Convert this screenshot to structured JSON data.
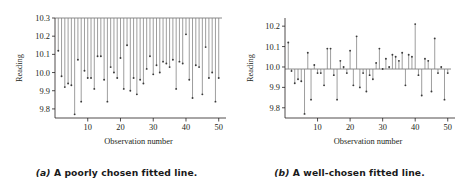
{
  "figure": {
    "background": "#ffffff",
    "ink": "#231f20",
    "line_color": "#7d7d7d",
    "marker_color": "#3a3a3a"
  },
  "panels": [
    {
      "key": "a",
      "caption_label": "(a)",
      "caption_text": "A poorly chosen fitted line.",
      "xlabel": "Observation number",
      "ylabel": "Reading",
      "yticks": [
        "9.8",
        "9.9",
        "10.0",
        "10.1",
        "10.2",
        "10.3"
      ],
      "xticks": [
        "10",
        "20",
        "30",
        "40",
        "50"
      ]
    },
    {
      "key": "b",
      "caption_label": "(b)",
      "caption_text": "A well-chosen fitted line.",
      "xlabel": "Observation number",
      "ylabel": "Reading",
      "yticks": [
        "9.8",
        "9.9",
        "10.0",
        "10.1",
        "10.2"
      ],
      "xticks": [
        "10",
        "20",
        "30",
        "40",
        "50"
      ]
    }
  ],
  "chart_data": [
    {
      "type": "scatter",
      "panel": "a",
      "title": "",
      "xlabel": "Observation number",
      "ylabel": "Reading",
      "xlim": [
        0,
        51
      ],
      "ylim": [
        9.75,
        10.3
      ],
      "yticks": [
        9.8,
        9.9,
        10.0,
        10.1,
        10.2,
        10.3
      ],
      "xticks": [
        10,
        20,
        30,
        40,
        50
      ],
      "grid": false,
      "legend": null,
      "fitted_line": {
        "type": "horizontal",
        "y": 10.3,
        "label": "poorly chosen fitted line"
      },
      "residual_drop_lines": true,
      "x": [
        1,
        2,
        3,
        4,
        5,
        6,
        7,
        8,
        9,
        10,
        11,
        12,
        13,
        14,
        15,
        16,
        17,
        18,
        19,
        20,
        21,
        22,
        23,
        24,
        25,
        26,
        27,
        28,
        29,
        30,
        31,
        32,
        33,
        34,
        35,
        36,
        37,
        38,
        39,
        40,
        41,
        42,
        43,
        44,
        45,
        46,
        47,
        48,
        49,
        50
      ],
      "values": [
        10.12,
        9.98,
        9.92,
        9.94,
        9.93,
        9.77,
        10.07,
        9.84,
        10.01,
        9.97,
        9.97,
        9.91,
        10.09,
        10.09,
        9.96,
        9.84,
        10.03,
        10.0,
        9.97,
        10.08,
        9.91,
        10.15,
        9.9,
        9.97,
        9.88,
        9.96,
        9.94,
        10.02,
        10.09,
        9.99,
        10.04,
        10.0,
        10.06,
        10.05,
        10.03,
        10.07,
        9.91,
        10.06,
        10.05,
        10.21,
        9.96,
        9.86,
        10.04,
        10.03,
        9.88,
        10.14,
        9.97,
        10.0,
        9.84,
        9.97
      ]
    },
    {
      "type": "scatter",
      "panel": "b",
      "title": "",
      "xlabel": "Observation number",
      "ylabel": "Reading",
      "xlim": [
        0,
        51
      ],
      "ylim": [
        9.75,
        10.24
      ],
      "yticks": [
        9.8,
        9.9,
        10.0,
        10.1,
        10.2
      ],
      "xticks": [
        10,
        20,
        30,
        40,
        50
      ],
      "grid": false,
      "legend": null,
      "fitted_line": {
        "type": "horizontal",
        "y": 9.99,
        "label": "well-chosen fitted line"
      },
      "residual_drop_lines": true,
      "x": [
        1,
        2,
        3,
        4,
        5,
        6,
        7,
        8,
        9,
        10,
        11,
        12,
        13,
        14,
        15,
        16,
        17,
        18,
        19,
        20,
        21,
        22,
        23,
        24,
        25,
        26,
        27,
        28,
        29,
        30,
        31,
        32,
        33,
        34,
        35,
        36,
        37,
        38,
        39,
        40,
        41,
        42,
        43,
        44,
        45,
        46,
        47,
        48,
        49,
        50
      ],
      "values": [
        10.12,
        9.98,
        9.92,
        9.94,
        9.93,
        9.77,
        10.07,
        9.84,
        10.01,
        9.97,
        9.97,
        9.91,
        10.09,
        10.09,
        9.96,
        9.84,
        10.03,
        10.0,
        9.97,
        10.08,
        9.91,
        10.15,
        9.9,
        9.97,
        9.88,
        9.96,
        9.94,
        10.02,
        10.09,
        9.99,
        10.04,
        10.0,
        10.06,
        10.05,
        10.03,
        10.07,
        9.91,
        10.06,
        10.05,
        10.21,
        9.96,
        9.86,
        10.04,
        10.03,
        9.88,
        10.14,
        9.97,
        10.0,
        9.84,
        9.97
      ]
    }
  ]
}
